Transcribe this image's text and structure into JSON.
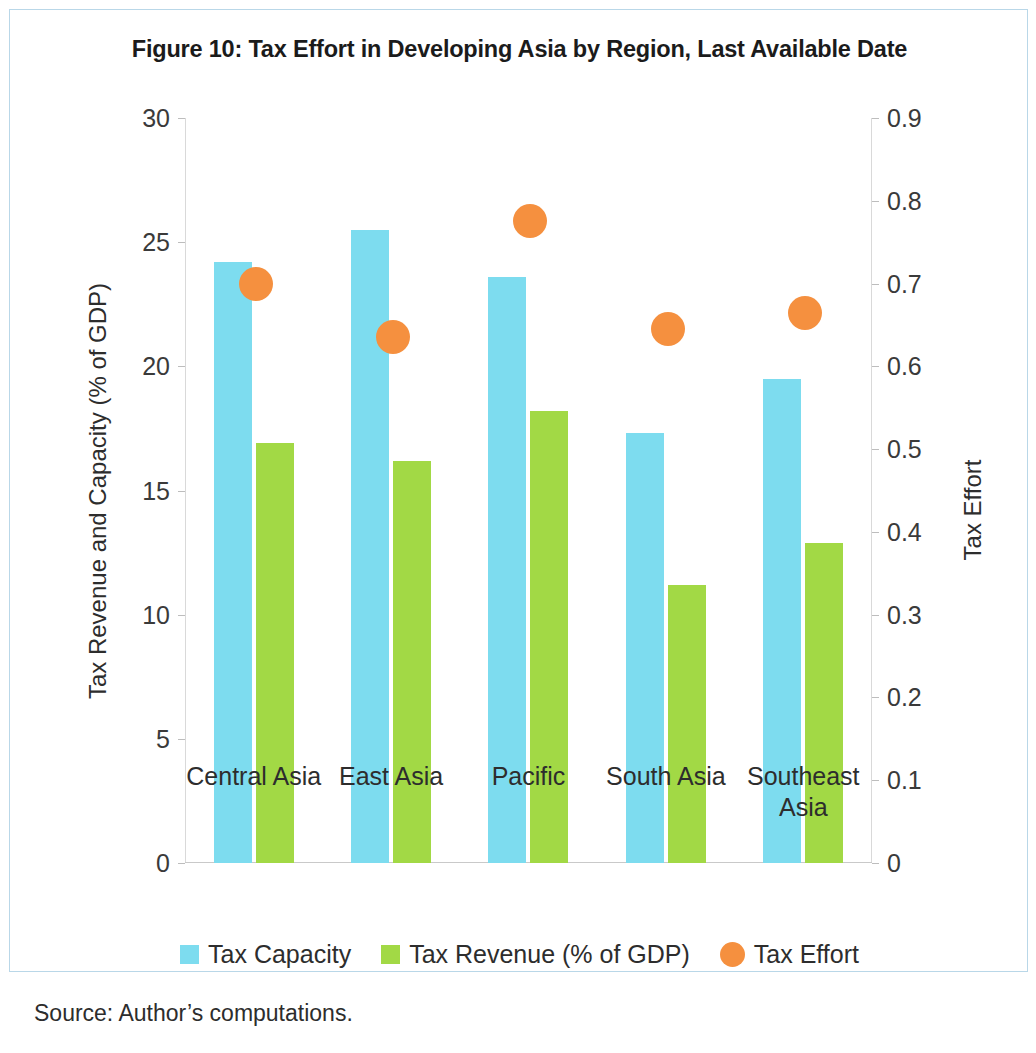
{
  "figure": {
    "title": "Figure 10: Tax Effort in Developing Asia by Region, Last Available Date",
    "source": "Source: Author’s computations."
  },
  "legend": {
    "items": [
      {
        "label": "Tax Capacity",
        "marker": "square-swatch",
        "color": "#7ddcef"
      },
      {
        "label": "Tax Revenue (% of GDP)",
        "marker": "square-swatch",
        "color": "#a2d945"
      },
      {
        "label": "Tax Effort",
        "marker": "circle-swatch",
        "color": "#f5903f"
      }
    ]
  },
  "chart_data": {
    "type": "bar",
    "title": "Figure 10: Tax Effort in Developing Asia by Region, Last Available Date",
    "xlabel": "",
    "ylabel": "Tax Revenue and Capacity (% of GDP)",
    "y2label": "Tax Effort",
    "ylim": [
      0,
      30
    ],
    "y2lim": [
      0,
      0.9
    ],
    "yticks": [
      "0",
      "5",
      "10",
      "15",
      "20",
      "25",
      "30"
    ],
    "ytick_values": [
      0,
      5,
      10,
      15,
      20,
      25,
      30
    ],
    "y2ticks": [
      "0",
      "0.1",
      "0.2",
      "0.3",
      "0.4",
      "0.5",
      "0.6",
      "0.7",
      "0.8",
      "0.9"
    ],
    "y2tick_values": [
      0,
      0.1,
      0.2,
      0.3,
      0.4,
      0.5,
      0.6,
      0.7,
      0.8,
      0.9
    ],
    "grid": false,
    "legend_position": "bottom",
    "categories": [
      "Central Asia",
      "East Asia",
      "Pacific",
      "South Asia",
      "Southeast\nAsia"
    ],
    "series": [
      {
        "name": "Tax Capacity",
        "type": "bar",
        "axis": "left",
        "color": "#7ddcef",
        "values": [
          24.2,
          25.5,
          23.6,
          17.3,
          19.5
        ]
      },
      {
        "name": "Tax Revenue (% of GDP)",
        "type": "bar",
        "axis": "left",
        "color": "#a2d945",
        "values": [
          16.9,
          16.2,
          18.2,
          11.2,
          12.9
        ]
      },
      {
        "name": "Tax Effort",
        "type": "scatter",
        "axis": "right",
        "color": "#f5903f",
        "values": [
          0.7,
          0.635,
          0.775,
          0.645,
          0.665
        ]
      }
    ]
  }
}
